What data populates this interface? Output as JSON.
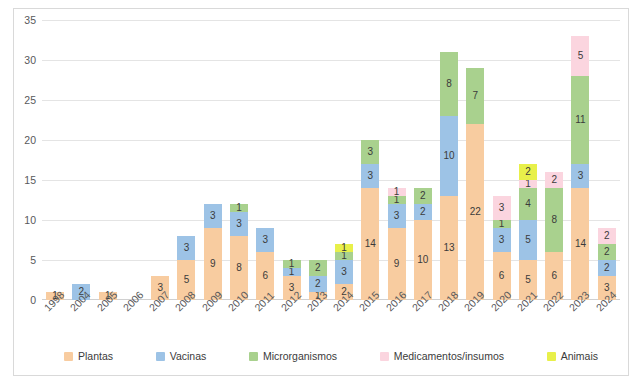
{
  "chart_data": {
    "type": "bar",
    "subtype": "stacked-bar",
    "title": "",
    "subtitle": "",
    "xlabel": "",
    "ylabel": "",
    "grid": true,
    "legend_position": "bottom",
    "ylim": [
      0,
      35
    ],
    "yticks": [
      0,
      5,
      10,
      15,
      20,
      25,
      30,
      35
    ],
    "categories": [
      "1998",
      "2004",
      "2005",
      "2006",
      "2007",
      "2008",
      "2009",
      "2010",
      "2011",
      "2012",
      "2013",
      "2014",
      "2015",
      "2016",
      "2017",
      "2018",
      "2019",
      "2020",
      "2021",
      "2022",
      "2023",
      "2024"
    ],
    "series": [
      {
        "name": "Plantas",
        "color": "#f8cca0",
        "values": [
          1,
          0,
          1,
          0,
          3,
          5,
          9,
          8,
          6,
          3,
          1,
          2,
          14,
          9,
          10,
          13,
          22,
          6,
          5,
          6,
          14,
          3
        ]
      },
      {
        "name": "Vacinas",
        "color": "#9dc3e6",
        "values": [
          0,
          2,
          0,
          0,
          0,
          3,
          3,
          3,
          3,
          1,
          2,
          3,
          3,
          3,
          2,
          10,
          0,
          3,
          5,
          0,
          3,
          2
        ]
      },
      {
        "name": "Microrganismos",
        "color": "#a9d18e",
        "values": [
          0,
          0,
          0,
          0,
          0,
          0,
          0,
          1,
          0,
          1,
          2,
          1,
          3,
          1,
          2,
          8,
          7,
          1,
          4,
          8,
          11,
          2
        ]
      },
      {
        "name": "Medicamentos/insumos",
        "color": "#fbd5df",
        "values": [
          0,
          0,
          0,
          0,
          0,
          0,
          0,
          0,
          0,
          0,
          0,
          0,
          0,
          1,
          0,
          0,
          0,
          3,
          1,
          2,
          5,
          2
        ]
      },
      {
        "name": "Animais",
        "color": "#e8f04a",
        "values": [
          0,
          0,
          0,
          0,
          0,
          0,
          0,
          0,
          0,
          0,
          0,
          1,
          0,
          0,
          0,
          0,
          0,
          0,
          2,
          0,
          0,
          0
        ]
      }
    ],
    "totals": [
      1,
      2,
      1,
      0,
      3,
      8,
      12,
      12,
      9,
      5,
      5,
      7,
      20,
      14,
      14,
      31,
      29,
      13,
      17,
      17,
      33,
      9
    ]
  }
}
